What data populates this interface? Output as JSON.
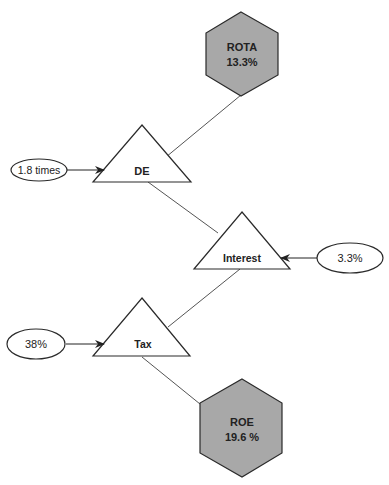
{
  "diagram": {
    "colors": {
      "hexagon_fill": "#a8a8a8",
      "stroke": "#2a2a2a",
      "connector": "#555555",
      "background": "#ffffff"
    },
    "hexagons": {
      "rota": {
        "title": "ROTA",
        "value": "13.3%"
      },
      "roe": {
        "title": "ROE",
        "value": "19.6 %"
      }
    },
    "triangles": {
      "de": {
        "label": "DE"
      },
      "interest": {
        "label": "Interest"
      },
      "tax": {
        "label": "Tax"
      }
    },
    "inputs": {
      "de_input": {
        "label": "1.8 times"
      },
      "interest_input": {
        "label": "3.3%"
      },
      "tax_input": {
        "label": "38%"
      }
    }
  }
}
